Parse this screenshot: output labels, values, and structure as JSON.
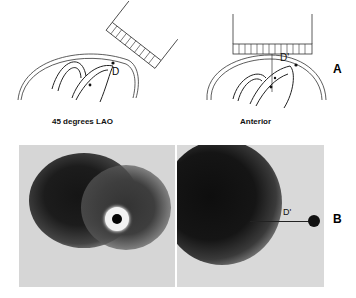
{
  "figure": {
    "panel_a": {
      "label": "A",
      "views": [
        {
          "name": "45-degrees-lao",
          "caption": "45 degrees LAO",
          "distance_label": "D"
        },
        {
          "name": "anterior",
          "caption": "Anterior",
          "distance_label": "D'"
        }
      ]
    },
    "panel_b": {
      "label": "B",
      "images": [
        {
          "name": "lao-scintigram",
          "marker": "ring-source"
        },
        {
          "name": "anterior-scintigram",
          "distance_label": "D'",
          "marker": "point-source"
        }
      ]
    }
  },
  "colors": {
    "background": "#ffffff",
    "ink": "#111111",
    "scan_bg": "#d9d9d9",
    "scan_dark": "#141414"
  }
}
